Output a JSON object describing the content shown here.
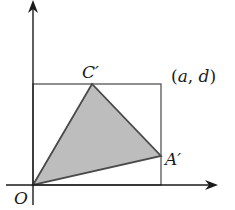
{
  "diagram": {
    "type": "coordinate-geometry",
    "labels": {
      "origin": "O",
      "vertex_c": "C′",
      "vertex_a": "A′",
      "corner_open": "(",
      "corner_a": "a",
      "corner_comma": ",",
      "corner_d": "d",
      "corner_close": ")"
    },
    "colors": {
      "stroke": "#4a4a4a",
      "fill": "#bdbdbd",
      "axis": "#1a1a1a"
    },
    "points": {
      "O": [
        33,
        185
      ],
      "C_prime": [
        92,
        84
      ],
      "A_prime": [
        161,
        156
      ],
      "corner": [
        161,
        84
      ]
    }
  }
}
